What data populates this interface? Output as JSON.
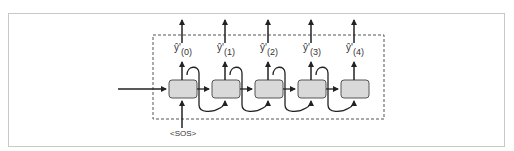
{
  "diagram": {
    "type": "rnn-decoder-unrolled",
    "start_token": "<SOS>",
    "cells": 5,
    "outputs": [
      {
        "symbol": "ŷ'",
        "sub": "(0)"
      },
      {
        "symbol": "ŷ'",
        "sub": "(1)"
      },
      {
        "symbol": "ŷ'",
        "sub": "(2)"
      },
      {
        "symbol": "ŷ'",
        "sub": "(3)"
      },
      {
        "symbol": "ŷ'",
        "sub": "(4)"
      }
    ],
    "colors": {
      "cell_fill": "#d9d9d9",
      "cell_stroke": "#555555",
      "arrow": "#222222",
      "dashed_border": "#555555",
      "frame_border": "#c8c8c8"
    }
  }
}
